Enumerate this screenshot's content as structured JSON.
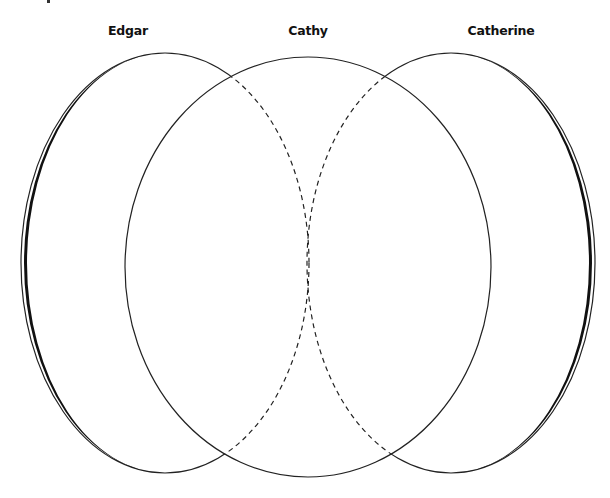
{
  "diagram": {
    "type": "venn",
    "sets": [
      {
        "id": "edgar",
        "label": "Edgar",
        "label_x": 128,
        "cx": 165,
        "cy": 263,
        "rx": 144,
        "ry": 210
      },
      {
        "id": "cathy",
        "label": "Cathy",
        "label_x": 308,
        "cx": 308,
        "cy": 267,
        "rx": 183,
        "ry": 210
      },
      {
        "id": "catherine",
        "label": "Catherine",
        "label_x": 501,
        "cx": 451,
        "cy": 263,
        "rx": 144,
        "ry": 210
      }
    ],
    "colors": {
      "stroke": "#111111",
      "background": "#ffffff"
    },
    "styles": {
      "outer_stroke": "solid, thickening toward outer side",
      "inner_overlap_stroke": "dashed"
    }
  }
}
